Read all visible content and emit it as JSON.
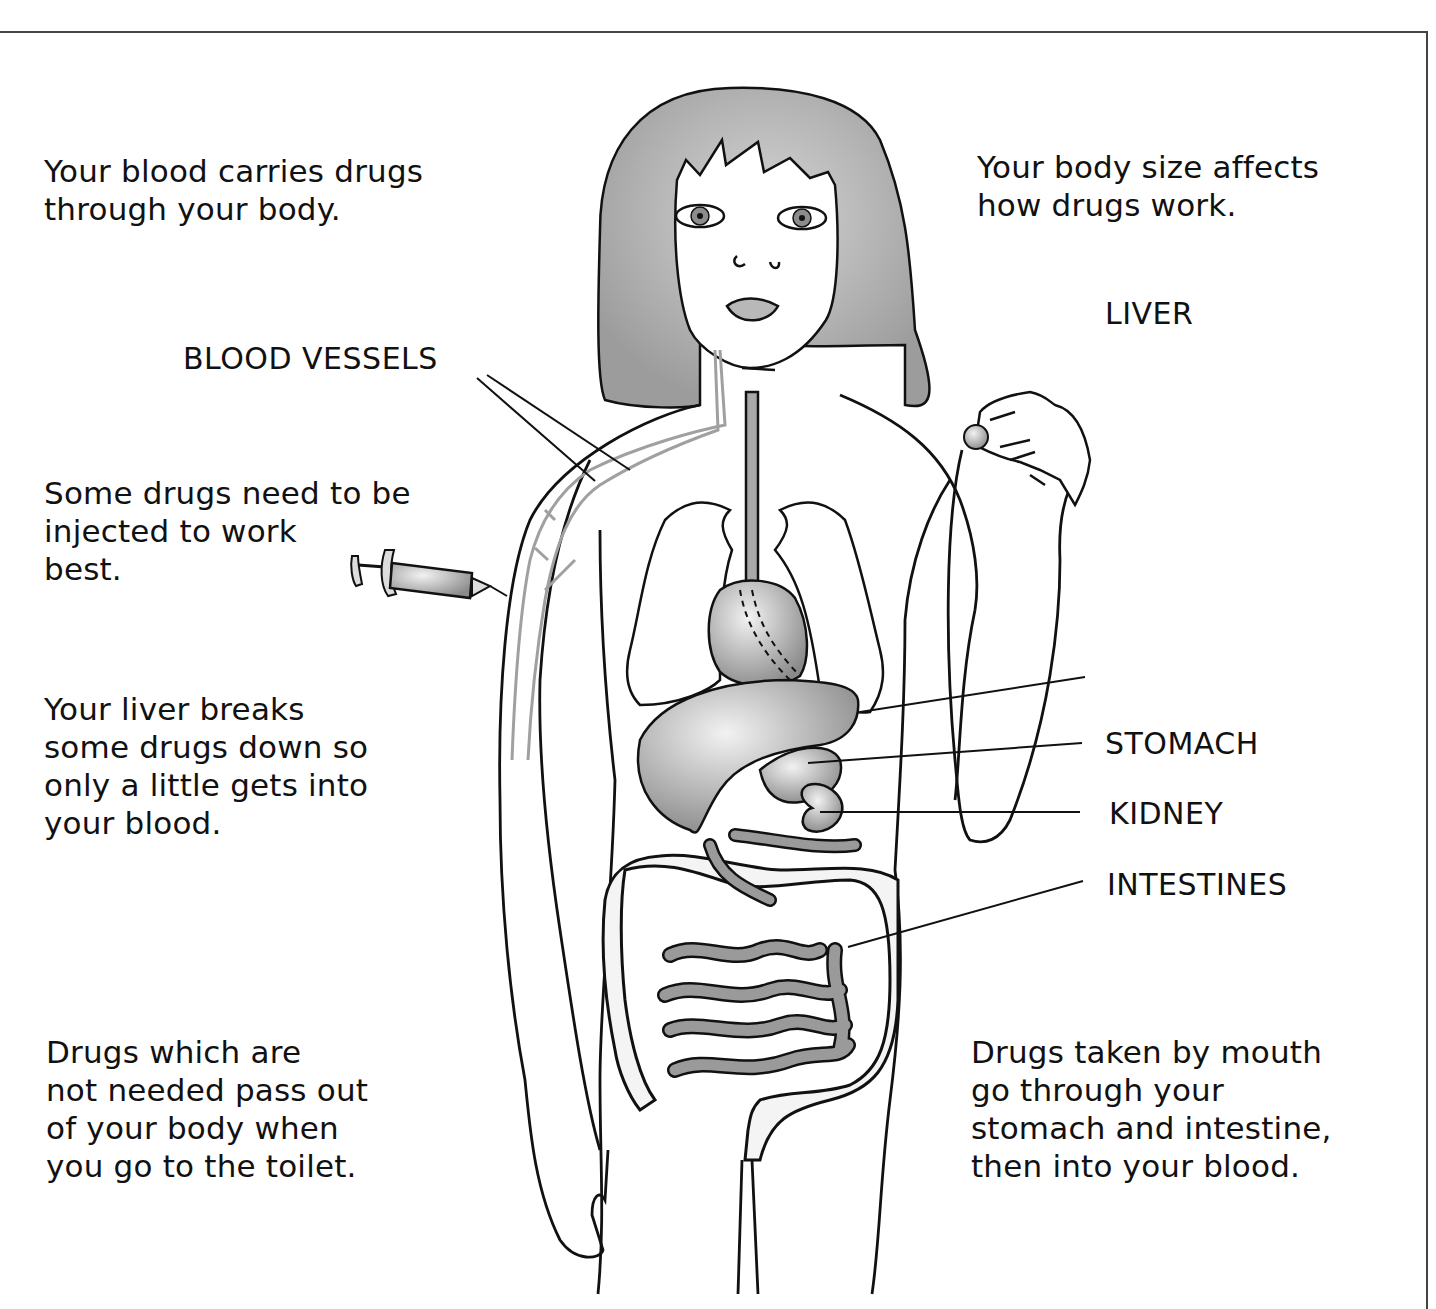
{
  "diagram": {
    "captions": {
      "blood_carries": "Your blood carries drugs\nthrough your body.",
      "body_size": "Your body size affects\nhow drugs work.",
      "injected": "Some drugs need to be\ninjected to work\nbest.",
      "liver_breaks": "Your liver breaks\nsome drugs down so\nonly a little gets into\nyour blood.",
      "pass_out": "Drugs which are\nnot needed pass out\nof your body when\nyou go to the toilet.",
      "by_mouth": "Drugs taken by mouth\ngo through your\nstomach and intestine,\nthen into your blood."
    },
    "labels": {
      "blood_vessels": "BLOOD VESSELS",
      "liver": "LIVER",
      "stomach": "STOMACH",
      "kidney": "KIDNEY",
      "intestines": "INTESTINES"
    },
    "illustration": {
      "figure": "girl-outline",
      "props": [
        "syringe",
        "pill-in-hand"
      ],
      "colors": {
        "outline": "#111111",
        "hair": "#a8a8a8",
        "organ_fill": "#9a9a9a",
        "vessel": "#a0a0a0",
        "frame": "#444444"
      }
    }
  }
}
